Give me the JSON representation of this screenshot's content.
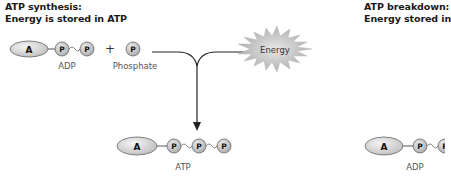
{
  "left_panel": {
    "title_line1": "ATP synthesis:",
    "title_line2": "Energy is stored in ATP",
    "reactants": {
      "adp": {
        "base_label": "A",
        "phosphates": [
          "P",
          "P"
        ],
        "caption": "ADP"
      },
      "plus": "+",
      "phosphate": {
        "label": "P",
        "caption": "Phosphate"
      }
    },
    "energy": {
      "label": "Energy"
    },
    "product": {
      "atp": {
        "base_label": "A",
        "phosphates": [
          "P",
          "P",
          "P"
        ],
        "caption": "ATP"
      }
    }
  },
  "right_panel": {
    "title_line1": "ATP breakdown:",
    "title_line2": "Energy stored in",
    "product": {
      "adp": {
        "base_label": "A",
        "phosphates": [
          "P",
          "P"
        ],
        "caption": "ADP"
      }
    }
  },
  "colors": {
    "molecule_fill": "#dcdcdc",
    "molecule_stroke": "#555555",
    "line": "#333333",
    "energy_fill": "#bdbdbd"
  }
}
